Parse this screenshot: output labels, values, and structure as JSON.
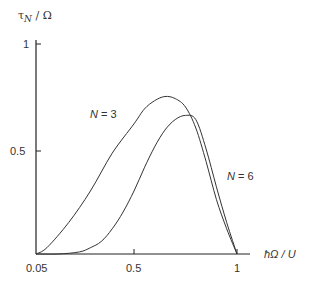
{
  "chart_data": {
    "type": "line",
    "title": "",
    "ylabel": "τ_N / Ω",
    "xlabel": "ħΩ / U",
    "x_ticks": [
      "0.05",
      "0.5",
      "1"
    ],
    "y_ticks": [
      "0.5",
      "1"
    ],
    "xlim": [
      0.05,
      1.05
    ],
    "ylim": [
      0,
      1
    ],
    "grid": false,
    "legend": "inline annotations",
    "series": [
      {
        "name": "N = 3",
        "x": [
          0.05,
          0.1,
          0.2,
          0.3,
          0.4,
          0.5,
          0.55,
          0.6,
          0.65,
          0.7,
          0.75,
          0.8,
          0.85,
          0.9,
          0.95,
          1.0
        ],
        "y": [
          0.0,
          0.03,
          0.15,
          0.3,
          0.48,
          0.62,
          0.69,
          0.73,
          0.75,
          0.74,
          0.7,
          0.6,
          0.44,
          0.26,
          0.12,
          0.0
        ]
      },
      {
        "name": "N = 6",
        "x": [
          0.05,
          0.15,
          0.25,
          0.3,
          0.35,
          0.4,
          0.45,
          0.5,
          0.55,
          0.6,
          0.65,
          0.7,
          0.75,
          0.8,
          0.85,
          0.9,
          0.95,
          1.0
        ],
        "y": [
          0.0,
          0.0,
          0.01,
          0.03,
          0.06,
          0.12,
          0.2,
          0.3,
          0.41,
          0.51,
          0.59,
          0.64,
          0.66,
          0.64,
          0.5,
          0.32,
          0.15,
          0.0
        ]
      }
    ],
    "annotations": [
      {
        "text": "N = 3",
        "x": 0.43,
        "y": 0.67
      },
      {
        "text": "N = 6",
        "x": 0.9,
        "y": 0.31
      }
    ]
  },
  "labels": {
    "y_axis": "τ",
    "y_axis_sub": "N",
    "y_axis_rest": " / Ω",
    "x_axis": "ħΩ / U",
    "x_tick_0": "0.05",
    "x_tick_1": "0.5",
    "x_tick_2": "1",
    "y_tick_1": "1",
    "y_tick_05": "0.5",
    "n3": "N",
    "n3_val": " = 3",
    "n6": "N",
    "n6_val": " = 6"
  }
}
